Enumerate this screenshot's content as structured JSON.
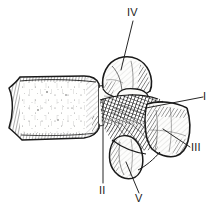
{
  "figure": {
    "kind": "anatomical-line-drawing",
    "background_color": "#ffffff",
    "ink_color": "#1a1a1a",
    "width": 214,
    "height": 211
  },
  "labels": [
    {
      "id": "label-I",
      "text": "I",
      "x": 205,
      "y": 91,
      "target": "pedicle / vertebral notch region",
      "leader": {
        "x1": 203,
        "y1": 97,
        "x2": 146,
        "y2": 108
      }
    },
    {
      "id": "label-II",
      "text": "II",
      "x": 100,
      "y": 185,
      "target": "vertebral body - pedicle junction",
      "leader": {
        "x1": 103,
        "y1": 183,
        "x2": 103,
        "y2": 99
      }
    },
    {
      "id": "label-III",
      "text": "III",
      "x": 192,
      "y": 143,
      "target": "spinous process",
      "leader": {
        "x1": 190,
        "y1": 147,
        "x2": 163,
        "y2": 129
      }
    },
    {
      "id": "label-IV",
      "text": "IV",
      "x": 128,
      "y": 8,
      "target": "superior articular process",
      "leader": {
        "x1": 133,
        "y1": 21,
        "x2": 121,
        "y2": 70
      }
    },
    {
      "id": "label-V",
      "text": "V",
      "x": 136,
      "y": 194,
      "target": "inferior articular process",
      "leader": {
        "x1": 139,
        "y1": 193,
        "x2": 126,
        "y2": 162
      }
    }
  ],
  "structures": [
    {
      "name": "vertebral-body",
      "label_ref": null
    },
    {
      "name": "pedicle",
      "label_ref": "I"
    },
    {
      "name": "body-pedicle-junction",
      "label_ref": "II"
    },
    {
      "name": "spinous-process",
      "label_ref": "III"
    },
    {
      "name": "superior-articular-process",
      "label_ref": "IV"
    },
    {
      "name": "inferior-articular-process",
      "label_ref": "V"
    }
  ]
}
